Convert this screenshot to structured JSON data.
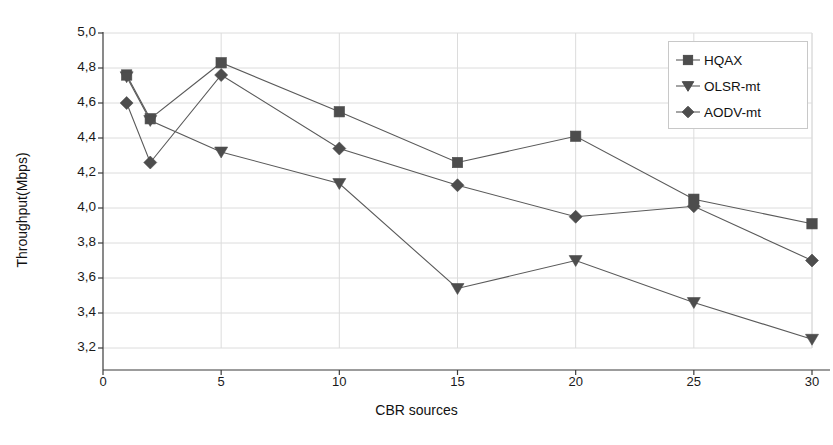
{
  "chart_data": {
    "type": "line",
    "title": "",
    "xlabel": "CBR sources",
    "ylabel": "Throughput(Mbps)",
    "x": [
      1,
      2,
      5,
      10,
      15,
      20,
      25,
      30
    ],
    "xlim": [
      0,
      30
    ],
    "ylim": [
      3.2,
      5.0
    ],
    "xticks": [
      "0",
      "5",
      "10",
      "15",
      "20",
      "25",
      "30"
    ],
    "xtick_values": [
      0,
      5,
      10,
      15,
      20,
      25,
      30
    ],
    "yticks": [
      "3,2",
      "3,4",
      "3,6",
      "3,8",
      "4,0",
      "4,2",
      "4,4",
      "4,6",
      "4,8",
      "5,0"
    ],
    "ytick_values": [
      3.2,
      3.4,
      3.6,
      3.8,
      4.0,
      4.2,
      4.4,
      4.6,
      4.8,
      5.0
    ],
    "grid": true,
    "legend_position": "top-right",
    "series": [
      {
        "name": "HQAX",
        "marker": "square",
        "color": "#4d4d4d",
        "values": [
          4.76,
          4.51,
          4.83,
          4.55,
          4.26,
          4.41,
          4.05,
          3.91
        ]
      },
      {
        "name": "OLSR-mt",
        "marker": "triangle-down",
        "color": "#4d4d4d",
        "values": [
          4.75,
          4.5,
          4.32,
          4.14,
          3.54,
          3.7,
          3.46,
          3.25
        ]
      },
      {
        "name": "AODV-mt",
        "marker": "diamond",
        "color": "#4d4d4d",
        "values": [
          4.6,
          4.26,
          4.76,
          4.34,
          4.13,
          3.95,
          4.01,
          3.7
        ]
      }
    ]
  },
  "colors": {
    "axis": "#3b3b3b",
    "grid": "#dcdcdc",
    "marker": "#4d4d4d",
    "line": "#5a5a5a",
    "legend_border": "#c8c8c8"
  },
  "legend": {
    "items": [
      {
        "label": "HQAX",
        "marker": "square"
      },
      {
        "label": "OLSR-mt",
        "marker": "triangle-down"
      },
      {
        "label": "AODV-mt",
        "marker": "diamond"
      }
    ]
  }
}
